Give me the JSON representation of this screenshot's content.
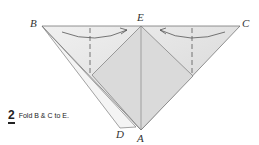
{
  "diagram": {
    "labels": {
      "B": "B",
      "E": "E",
      "C": "C",
      "D": "D",
      "A": "A"
    },
    "step_number": "2",
    "instruction": "Fold B & C to E.",
    "colors": {
      "paper": "#e4e4e4",
      "paper_dark": "#cfcfcf",
      "line": "#555555"
    }
  }
}
